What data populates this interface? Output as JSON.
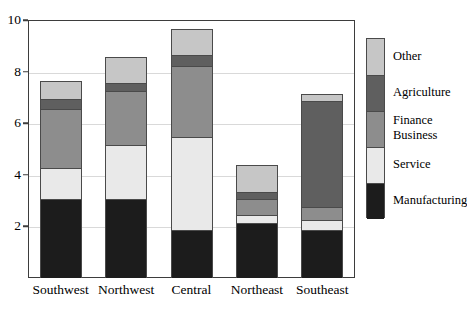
{
  "chart_data": {
    "type": "bar",
    "subtype": "stacked-bar",
    "title": "",
    "xlabel": "",
    "ylabel": "",
    "ylim": [
      0,
      10
    ],
    "ytick_values": [
      2,
      4,
      6,
      8,
      10
    ],
    "ytick_labels": [
      "2",
      "4",
      "6",
      "8",
      "10"
    ],
    "grid": true,
    "grid_axis": "y",
    "legend_position": "right",
    "categories": [
      "Southwest",
      "Northwest",
      "Central",
      "Northeast",
      "Southeast"
    ],
    "series": [
      {
        "name": "Manufacturing",
        "color": "#1c1c1c",
        "values": [
          3.05,
          3.05,
          1.85,
          2.15,
          1.85
        ]
      },
      {
        "name": "Service",
        "color": "#e9e9e9",
        "values": [
          1.2,
          2.1,
          3.6,
          0.3,
          0.4
        ]
      },
      {
        "name": "Finance\nBusiness",
        "color": "#8d8d8d",
        "values": [
          2.3,
          2.1,
          2.75,
          0.6,
          0.5
        ]
      },
      {
        "name": "Agriculture",
        "color": "#5f5f5f",
        "values": [
          0.4,
          0.3,
          0.45,
          0.3,
          4.1
        ]
      },
      {
        "name": "Other",
        "color": "#c6c6c6",
        "values": [
          0.7,
          1.0,
          1.0,
          1.05,
          0.3
        ]
      }
    ],
    "totals": [
      7.65,
      8.55,
      9.65,
      4.4,
      7.15
    ]
  },
  "legend": {
    "entries": [
      {
        "label": "Other",
        "color": "#c6c6c6"
      },
      {
        "label": "Agriculture",
        "color": "#5f5f5f"
      },
      {
        "label": "Finance\nBusiness",
        "color": "#8d8d8d"
      },
      {
        "label": "Service",
        "color": "#e9e9e9"
      },
      {
        "label": "Manufacturing",
        "color": "#1c1c1c"
      }
    ]
  },
  "style": {
    "frame_color": "#3d3d3d",
    "grid_color": "#d9d9d9",
    "background": "#ffffff",
    "text_color": "#000000"
  }
}
